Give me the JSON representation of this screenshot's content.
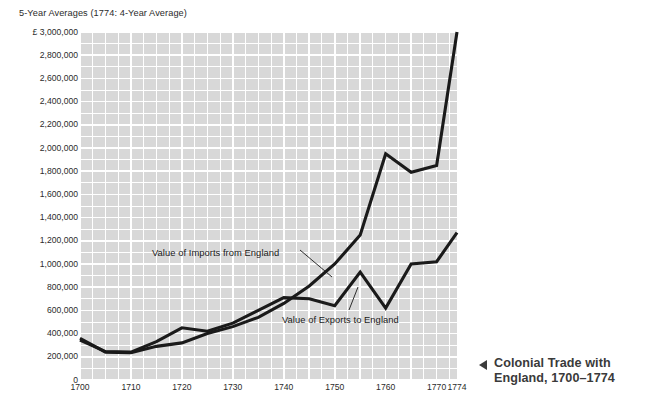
{
  "chart_data": {
    "type": "line",
    "title": "5-Year Averages (1774: 4-Year Average)",
    "xlabel": "",
    "ylabel": "",
    "y_axis_prefix": "£",
    "xlim": [
      1700,
      1774
    ],
    "ylim": [
      0,
      3000000
    ],
    "grid": true,
    "grid_color": "#ffffff",
    "plot_background": "#d8d8d8",
    "legend_position": "inline-annotations",
    "y_ticks": [
      "£ 3,000,000",
      "2,800,000",
      "2,600,000",
      "2,400,000",
      "2,200,000",
      "2,000,000",
      "1,800,000",
      "1,600,000",
      "1,400,000",
      "1,200,000",
      "1,000,000",
      "800,000",
      "600,000",
      "400,000",
      "200,000",
      "0"
    ],
    "y_tick_values": [
      3000000,
      2800000,
      2600000,
      2400000,
      2200000,
      2000000,
      1800000,
      1600000,
      1400000,
      1200000,
      1000000,
      800000,
      600000,
      400000,
      200000,
      0
    ],
    "x_ticks": [
      "1700",
      "1710",
      "1720",
      "1730",
      "1740",
      "1750",
      "1760",
      "1770",
      "1774"
    ],
    "x_tick_values": [
      1700,
      1710,
      1720,
      1730,
      1740,
      1750,
      1760,
      1770,
      1774
    ],
    "x": [
      1700,
      1705,
      1710,
      1715,
      1720,
      1725,
      1730,
      1735,
      1740,
      1745,
      1750,
      1755,
      1760,
      1765,
      1770,
      1774
    ],
    "series": [
      {
        "name": "Value of Imports from England",
        "color": "#1a1a1a",
        "values": [
          360000,
          240000,
          235000,
          290000,
          320000,
          400000,
          460000,
          540000,
          660000,
          810000,
          1000000,
          1250000,
          1950000,
          1790000,
          1850000,
          3000000
        ]
      },
      {
        "name": "Value of Exports to England",
        "color": "#1a1a1a",
        "values": [
          345000,
          245000,
          240000,
          330000,
          450000,
          420000,
          490000,
          600000,
          710000,
          700000,
          640000,
          930000,
          620000,
          1000000,
          1020000,
          1270000
        ]
      }
    ],
    "annotations": [
      {
        "text": "Value of Imports from England",
        "series": "Value of Imports from England"
      },
      {
        "text": "Value of Exports to England",
        "series": "Value of Exports to England"
      }
    ]
  },
  "caption": {
    "marker": "left-triangle",
    "line_1": "Colonial Trade with",
    "line_2": "England, 1700–1774"
  }
}
